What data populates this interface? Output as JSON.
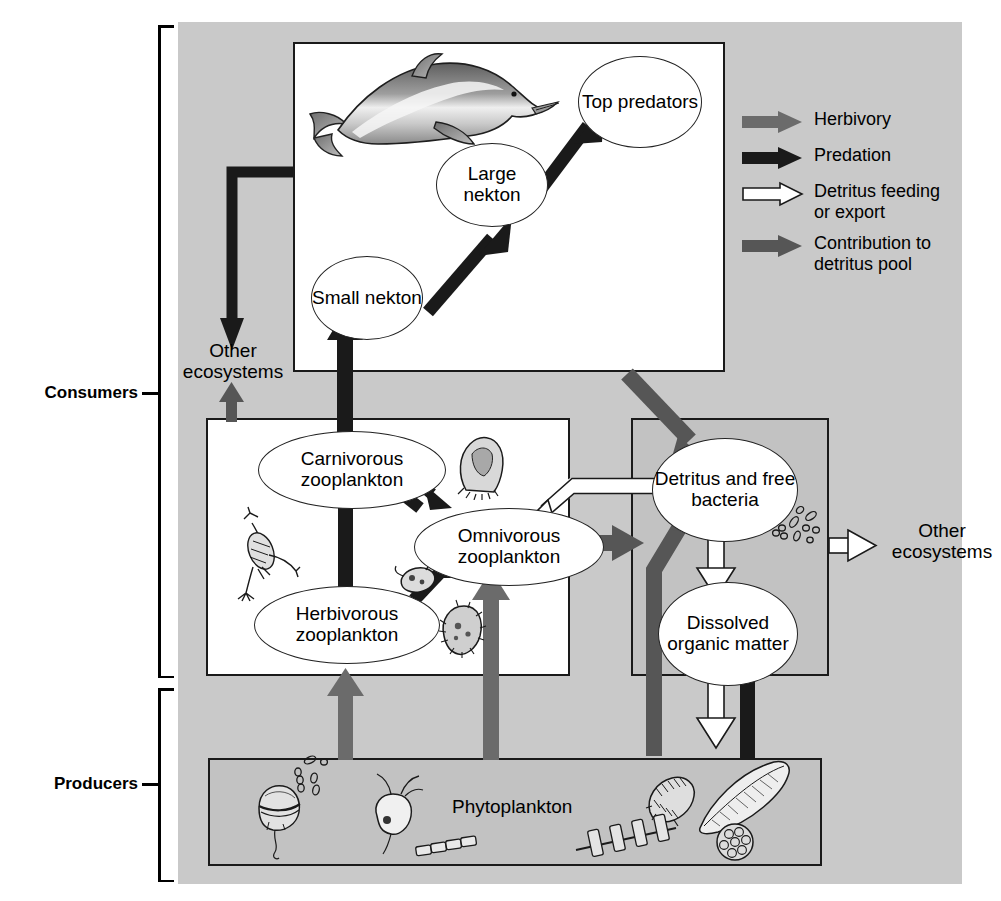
{
  "diagram": {
    "background_color": "#c9c9c9"
  },
  "categories": [
    {
      "id": "consumers",
      "label": "Consumers"
    },
    {
      "id": "producers",
      "label": "Producers"
    }
  ],
  "legend": {
    "items": [
      {
        "id": "herbivory",
        "label": "Herbivory",
        "color": "#6b6b6b",
        "style": "solid"
      },
      {
        "id": "predation",
        "label": "Predation",
        "color": "#1a1a1a",
        "style": "solid"
      },
      {
        "id": "detritus-feeding",
        "label": "Detritus feeding\nor export",
        "color": "#ffffff",
        "style": "outline"
      },
      {
        "id": "detritus-contribution",
        "label": "Contribution to\ndetritus pool",
        "color": "#565656",
        "style": "solid"
      }
    ]
  },
  "boxes": {
    "nekton": {
      "id": "nekton-box",
      "fill": "white"
    },
    "zooplankton": {
      "id": "zooplankton-box",
      "fill": "white"
    },
    "detritus": {
      "id": "detritus-box",
      "fill": "gray"
    },
    "phytoplankton": {
      "id": "phytoplankton-box",
      "fill": "gray",
      "title": "Phytoplankton"
    }
  },
  "nodes": [
    {
      "id": "top-predators",
      "label": "Top\npredators",
      "group": "nekton"
    },
    {
      "id": "large-nekton",
      "label": "Large\nnekton",
      "group": "nekton"
    },
    {
      "id": "small-nekton",
      "label": "Small\nnekton",
      "group": "nekton"
    },
    {
      "id": "carnivorous-zooplankton",
      "label": "Carnivorous\nzooplankton",
      "group": "zooplankton"
    },
    {
      "id": "omnivorous-zooplankton",
      "label": "Omnivorous\nzooplankton",
      "group": "zooplankton"
    },
    {
      "id": "herbivorous-zooplankton",
      "label": "Herbivorous\nzooplankton",
      "group": "zooplankton"
    },
    {
      "id": "detritus-and-free-bacteria",
      "label": "Detritus\nand free\nbacteria",
      "group": "detritus"
    },
    {
      "id": "dissolved-organic-matter",
      "label": "Dissolved\norganic\nmatter",
      "group": "detritus"
    }
  ],
  "external_labels": [
    {
      "id": "other-ecosystems-left",
      "label": "Other\necosystems"
    },
    {
      "id": "other-ecosystems-right",
      "label": "Other\necosystems"
    }
  ],
  "flows": [
    {
      "from": "small-nekton",
      "to": "large-nekton",
      "type": "predation"
    },
    {
      "from": "large-nekton",
      "to": "top-predators",
      "type": "predation"
    },
    {
      "from": "carnivorous-zooplankton",
      "to": "small-nekton",
      "type": "predation"
    },
    {
      "from": "herbivorous-zooplankton",
      "to": "carnivorous-zooplankton",
      "type": "predation"
    },
    {
      "from": "herbivorous-zooplankton",
      "to": "omnivorous-zooplankton",
      "type": "predation"
    },
    {
      "from": "omnivorous-zooplankton",
      "to": "carnivorous-zooplankton",
      "type": "predation"
    },
    {
      "from": "carnivorous-zooplankton",
      "to": "omnivorous-zooplankton",
      "type": "predation"
    },
    {
      "from": "nekton-box",
      "to": "other-ecosystems-left",
      "type": "predation"
    },
    {
      "from": "zooplankton-box",
      "to": "other-ecosystems-left",
      "type": "detritus-contribution"
    },
    {
      "from": "phytoplankton",
      "to": "herbivorous-zooplankton",
      "type": "herbivory"
    },
    {
      "from": "phytoplankton",
      "to": "omnivorous-zooplankton",
      "type": "herbivory"
    },
    {
      "from": "nekton-box",
      "to": "detritus-and-free-bacteria",
      "type": "detritus-contribution"
    },
    {
      "from": "omnivorous-zooplankton",
      "to": "detritus-and-free-bacteria",
      "type": "detritus-contribution"
    },
    {
      "from": "phytoplankton",
      "to": "detritus-and-free-bacteria",
      "type": "detritus-contribution"
    },
    {
      "from": "phytoplankton",
      "to": "dissolved-organic-matter",
      "type": "detritus-contribution"
    },
    {
      "from": "detritus-and-free-bacteria",
      "to": "omnivorous-zooplankton",
      "type": "detritus-feeding"
    },
    {
      "from": "detritus-and-free-bacteria",
      "to": "dissolved-organic-matter",
      "type": "detritus-feeding"
    },
    {
      "from": "dissolved-organic-matter",
      "to": "phytoplankton",
      "type": "detritus-feeding"
    },
    {
      "from": "detritus-box",
      "to": "other-ecosystems-right",
      "type": "detritus-feeding"
    }
  ],
  "organisms": [
    {
      "id": "dolphin",
      "in": "nekton-box"
    },
    {
      "id": "copepod",
      "in": "zooplankton-box"
    },
    {
      "id": "tintinnid",
      "in": "zooplankton-box"
    },
    {
      "id": "flagellate",
      "in": "zooplankton-box"
    },
    {
      "id": "radiolarian",
      "in": "zooplankton-box"
    },
    {
      "id": "bacteria",
      "in": "detritus-box"
    },
    {
      "id": "dinoflagellate",
      "in": "phytoplankton-box"
    },
    {
      "id": "bacteria-chain",
      "in": "phytoplankton-box"
    },
    {
      "id": "flagellate-cell",
      "in": "phytoplankton-box"
    },
    {
      "id": "diatom-chain",
      "in": "phytoplankton-box"
    },
    {
      "id": "centric-diatom",
      "in": "phytoplankton-box"
    },
    {
      "id": "pennate-diatom",
      "in": "phytoplankton-box"
    },
    {
      "id": "colonial-alga",
      "in": "phytoplankton-box"
    },
    {
      "id": "chain-diatom",
      "in": "phytoplankton-box"
    }
  ],
  "colors": {
    "herbivory": "#6b6b6b",
    "predation": "#1a1a1a",
    "detritus_feeding": "#ffffff",
    "detritus_contribution": "#565656",
    "panel": "#c9c9c9",
    "box_gray": "#c2c2c2"
  }
}
